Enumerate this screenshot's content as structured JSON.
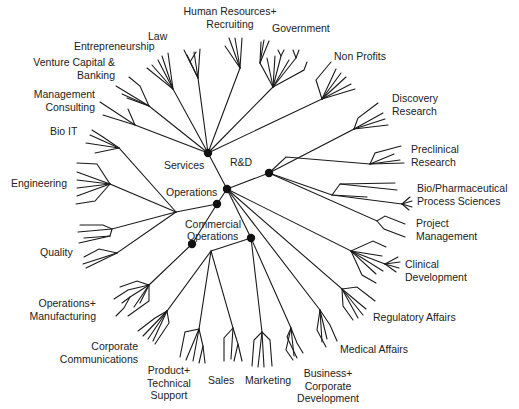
{
  "diagram": {
    "colors": {
      "line": "#1a1a1a",
      "node": "#111111",
      "text": "#222222",
      "background": "#ffffff"
    },
    "hubs": [
      {
        "id": "services",
        "label": "Services",
        "x": 208,
        "y": 153,
        "label_x": 163,
        "label_y": 163
      },
      {
        "id": "rnd",
        "label": "R&D",
        "x": 227,
        "y": 189,
        "label_x": 230,
        "label_y": 159
      },
      {
        "id": "rnd_right",
        "label": "",
        "x": 269,
        "y": 173
      },
      {
        "id": "operations",
        "label": "Operations",
        "x": 217,
        "y": 204,
        "label_x": 166,
        "label_y": 186
      },
      {
        "id": "commercial_left",
        "label": "",
        "x": 192,
        "y": 244
      },
      {
        "id": "commercial",
        "label": "Commercial\nOperations",
        "x": 251,
        "y": 238,
        "label_x": 185,
        "label_y": 217
      }
    ],
    "hub_labels": {
      "services": "Services",
      "rnd": "R&D",
      "operations": "Operations",
      "commercial_line1": "Commercial",
      "commercial_line2": "Operations"
    },
    "categories": [
      {
        "id": "law",
        "group": "Services",
        "label": [
          "Law"
        ],
        "x": 147,
        "y": 31,
        "align": "l"
      },
      {
        "id": "hr",
        "group": "Services",
        "label": [
          "Human Resources+",
          "Recruiting"
        ],
        "x": 178,
        "y": 6,
        "align": "c"
      },
      {
        "id": "government",
        "group": "Services",
        "label": [
          "Government"
        ],
        "x": 272,
        "y": 22,
        "align": "l"
      },
      {
        "id": "nonprofits",
        "group": "Services",
        "label": [
          "Non Profits"
        ],
        "x": 334,
        "y": 50,
        "align": "l"
      },
      {
        "id": "entrepreneurship",
        "group": "Services",
        "label": [
          "Entrepreneurship"
        ],
        "x": 73,
        "y": 40,
        "align": "l"
      },
      {
        "id": "venture",
        "group": "Services",
        "label": [
          "Venture Capital &",
          "Banking"
        ],
        "x": 33,
        "y": 55,
        "align": "r"
      },
      {
        "id": "management_consulting",
        "group": "Services",
        "label": [
          "Management",
          "Consulting"
        ],
        "x": 31,
        "y": 88,
        "align": "r"
      },
      {
        "id": "bio_it",
        "group": "Operations",
        "label": [
          "Bio IT"
        ],
        "x": 50,
        "y": 124,
        "align": "l"
      },
      {
        "id": "engineering",
        "group": "Operations",
        "label": [
          "Engineering"
        ],
        "x": 11,
        "y": 177,
        "align": "l"
      },
      {
        "id": "quality",
        "group": "Operations",
        "label": [
          "Quality"
        ],
        "x": 40,
        "y": 246,
        "align": "l"
      },
      {
        "id": "ops_manufacturing",
        "group": "Operations",
        "label": [
          "Operations+",
          "Manufacturing"
        ],
        "x": 28,
        "y": 298,
        "align": "r"
      },
      {
        "id": "corp_comm",
        "group": "Commercial Operations",
        "label": [
          "Corporate",
          "Communications"
        ],
        "x": 59,
        "y": 340,
        "align": "r"
      },
      {
        "id": "product_support",
        "group": "Commercial Operations",
        "label": [
          "Product+",
          "Technical",
          "Support"
        ],
        "x": 145,
        "y": 363,
        "align": "c"
      },
      {
        "id": "sales",
        "group": "Commercial Operations",
        "label": [
          "Sales"
        ],
        "x": 208,
        "y": 374,
        "align": "l"
      },
      {
        "id": "marketing",
        "group": "Commercial Operations",
        "label": [
          "Marketing"
        ],
        "x": 245,
        "y": 374,
        "align": "l"
      },
      {
        "id": "bizdev",
        "group": "Commercial Operations",
        "label": [
          "Business+",
          "Corporate",
          "Development"
        ],
        "x": 296,
        "y": 368,
        "align": "c"
      },
      {
        "id": "medical_affairs",
        "group": "R&D",
        "label": [
          "Medical Affairs"
        ],
        "x": 340,
        "y": 344,
        "align": "l"
      },
      {
        "id": "regulatory_affairs",
        "group": "R&D",
        "label": [
          "Regulatory Affairs"
        ],
        "x": 373,
        "y": 311,
        "align": "l"
      },
      {
        "id": "clinical_dev",
        "group": "R&D",
        "label": [
          "Clinical",
          "Development"
        ],
        "x": 405,
        "y": 258,
        "align": "l"
      },
      {
        "id": "project_mgmt",
        "group": "R&D",
        "label": [
          "Project",
          "Management"
        ],
        "x": 416,
        "y": 217,
        "align": "l"
      },
      {
        "id": "bio_pharma",
        "group": "R&D",
        "label": [
          "Bio/Pharmaceutical",
          "Process Sciences"
        ],
        "x": 417,
        "y": 182,
        "align": "l"
      },
      {
        "id": "preclinical",
        "group": "R&D",
        "label": [
          "Preclinical",
          "Research"
        ],
        "x": 411,
        "y": 143,
        "align": "l"
      },
      {
        "id": "discovery",
        "group": "R&D",
        "label": [
          "Discovery",
          "Research"
        ],
        "x": 392,
        "y": 92,
        "align": "l"
      }
    ]
  }
}
